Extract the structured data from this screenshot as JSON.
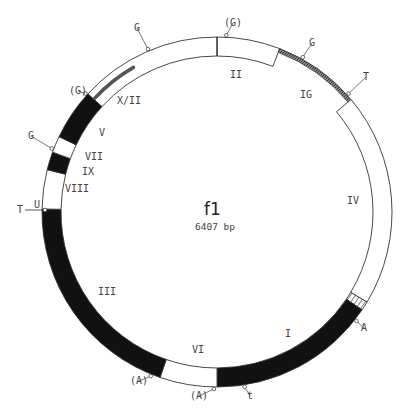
{
  "title": "f1",
  "subtitle": "6407 bp",
  "geometry": {
    "cx": 217,
    "cy": 212,
    "r_outer": 175,
    "r_inner": 156
  },
  "colors": {
    "line": "#333333",
    "dark": "#111111",
    "fill": "#ffffff",
    "hatch": "#555555"
  },
  "segments": [
    {
      "name": "II",
      "start": 0,
      "end": 21,
      "style": "white"
    },
    {
      "name": "IG",
      "start": 21,
      "end": 50,
      "style": "thin-hatch"
    },
    {
      "name": "IV",
      "start": 50,
      "end": 121,
      "style": "white"
    },
    {
      "name": "IV-I-junction",
      "start": 121,
      "end": 124,
      "style": "hatch-band"
    },
    {
      "name": "I",
      "start": 124,
      "end": 180,
      "style": "black"
    },
    {
      "name": "VI",
      "start": 180,
      "end": 199,
      "style": "white"
    },
    {
      "name": "III",
      "start": 199,
      "end": 271,
      "style": "black"
    },
    {
      "name": "VIII",
      "start": 271,
      "end": 284,
      "style": "white"
    },
    {
      "name": "IX",
      "start": 284,
      "end": 290,
      "style": "black"
    },
    {
      "name": "VII",
      "start": 290,
      "end": 295.5,
      "style": "white"
    },
    {
      "name": "V",
      "start": 295.5,
      "end": 312.5,
      "style": "black"
    },
    {
      "name": "X/II",
      "start": 312.5,
      "end": 360,
      "style": "white"
    }
  ],
  "inner_stripe": {
    "name": "X",
    "start": 313,
    "end": 330
  },
  "region_labels": [
    {
      "text": "II",
      "x": 230,
      "y": 78
    },
    {
      "text": "IG",
      "x": 300,
      "y": 98
    },
    {
      "text": "IV",
      "x": 347,
      "y": 204
    },
    {
      "text": "I",
      "x": 285,
      "y": 337
    },
    {
      "text": "VI",
      "x": 192,
      "y": 353
    },
    {
      "text": "III",
      "x": 98,
      "y": 295
    },
    {
      "text": "VIII",
      "x": 65,
      "y": 192
    },
    {
      "text": "IX",
      "x": 82,
      "y": 175
    },
    {
      "text": "VII",
      "x": 85,
      "y": 160
    },
    {
      "text": "V",
      "x": 99,
      "y": 136
    },
    {
      "text": "X/II",
      "x": 117,
      "y": 104
    }
  ],
  "markers": [
    {
      "text": "(G)",
      "angle": 3,
      "px": 226,
      "py": 37,
      "lx": 224,
      "ly": 26
    },
    {
      "text": "G",
      "angle": 29,
      "px": 300,
      "py": 61,
      "lx": 309,
      "ly": 46
    },
    {
      "text": "T",
      "angle": 48,
      "px": 343,
      "py": 99,
      "lx": 363,
      "ly": 80
    },
    {
      "text": "A",
      "angle": 128,
      "px": 357,
      "py": 322,
      "lx": 361,
      "ly": 331
    },
    {
      "text": "t",
      "angle": 171,
      "px": 246,
      "py": 387,
      "lx": 247,
      "ly": 399
    },
    {
      "text": "(A)",
      "angle": 181,
      "px": 212,
      "py": 389,
      "lx": 190,
      "ly": 399
    },
    {
      "text": "(A)",
      "angle": 202,
      "px": 154,
      "py": 375,
      "lx": 130,
      "ly": 384
    },
    {
      "text": "G",
      "angle": 291,
      "px": 53,
      "py": 147,
      "lx": 28,
      "ly": 139
    },
    {
      "text": "(G)",
      "angle": 312,
      "px": 93,
      "py": 98,
      "lx": 69,
      "ly": 94
    },
    {
      "text": "G",
      "angle": 337,
      "px": 148,
      "py": 50,
      "lx": 134,
      "ly": 31
    }
  ],
  "origin_marker": {
    "t_label": "T",
    "u_label": "U",
    "t_x": 17,
    "t_y": 213,
    "u_x": 34,
    "u_y": 212
  },
  "top_divider_angle": 0
}
